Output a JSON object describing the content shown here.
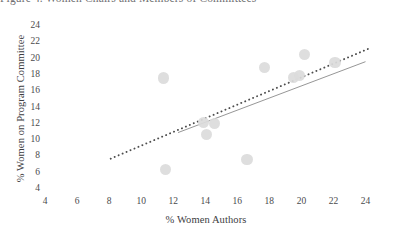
{
  "caption": {
    "text": "Figure 4. Women Chairs and Members of Committees"
  },
  "chart_data": {
    "type": "scatter",
    "title": "",
    "xlabel": "% Women Authors",
    "ylabel": "% Women on Program Committee",
    "xlim": [
      4,
      24
    ],
    "ylim": [
      4,
      24
    ],
    "xticks": [
      4,
      6,
      8,
      10,
      12,
      14,
      16,
      18,
      20,
      22,
      24
    ],
    "yticks": [
      4,
      6,
      8,
      10,
      12,
      14,
      16,
      18,
      20,
      22,
      24
    ],
    "grid": false,
    "legend": "none",
    "marker_color": "#dcdcdc",
    "points": [
      {
        "x": 11.4,
        "y": 17.5
      },
      {
        "x": 11.5,
        "y": 6.3
      },
      {
        "x": 13.9,
        "y": 12.0
      },
      {
        "x": 14.1,
        "y": 10.6
      },
      {
        "x": 14.6,
        "y": 11.9
      },
      {
        "x": 16.6,
        "y": 7.5
      },
      {
        "x": 17.7,
        "y": 18.8
      },
      {
        "x": 19.5,
        "y": 17.6
      },
      {
        "x": 19.9,
        "y": 17.8
      },
      {
        "x": 20.2,
        "y": 20.4
      },
      {
        "x": 22.1,
        "y": 19.4
      }
    ],
    "trendlines": [
      {
        "name": "dotted-trend",
        "style": "dotted",
        "color": "#4d4d4d",
        "x0": 8.1,
        "y0": 7.6,
        "x1": 24.2,
        "y1": 21.1
      },
      {
        "name": "solid-trend",
        "style": "solid",
        "color": "#8a8a8a",
        "x0": 12.3,
        "y0": 10.8,
        "x1": 24.0,
        "y1": 19.5
      }
    ]
  }
}
